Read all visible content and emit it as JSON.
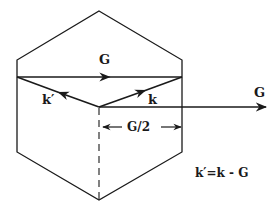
{
  "diagram": {
    "colors": {
      "stroke": "#1a1a1a",
      "background": "#ffffff"
    },
    "labels": {
      "g_top": "G",
      "k_prime": "k′",
      "k": "k",
      "g_right": "G",
      "g_half": "G/2",
      "equation": "k′=k - G"
    },
    "shapes": {
      "zone_boundary": "hexagon",
      "vectors": [
        {
          "name": "G (across zone)",
          "from": [
            17,
            77
          ],
          "to": [
            182,
            77
          ]
        },
        {
          "name": "k",
          "from": [
            99,
            107
          ],
          "to": [
            182,
            77
          ]
        },
        {
          "name": "k'",
          "from": [
            99,
            107
          ],
          "to": [
            17,
            77
          ]
        },
        {
          "name": "G (reciprocal lattice vector)",
          "from": [
            99,
            107
          ],
          "to": [
            265,
            107
          ]
        }
      ],
      "dimension": {
        "name": "G/2",
        "from_x": 103,
        "to_x": 182,
        "y": 127
      },
      "dashed_axis": {
        "x": 99,
        "from_y": 107,
        "to_y": 200
      }
    }
  }
}
